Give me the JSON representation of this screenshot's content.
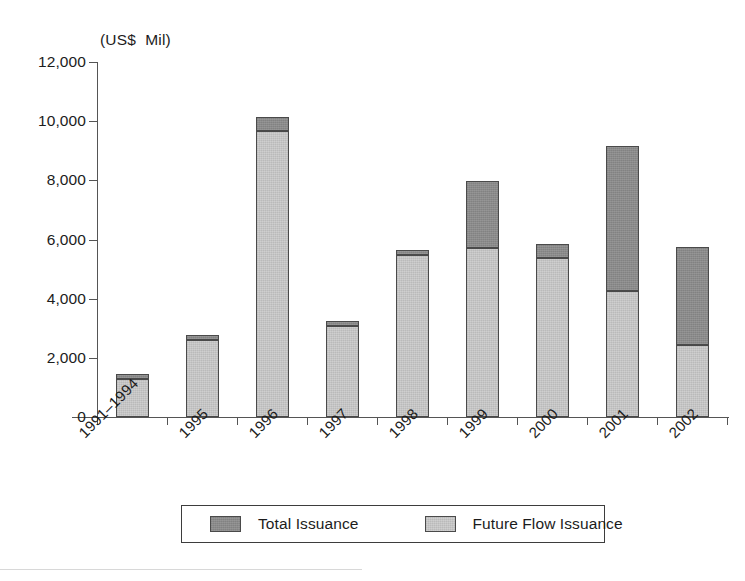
{
  "units_caption": "(US$  Mil)",
  "axis": {
    "y_ticks": [
      "0",
      "2,000",
      "4,000",
      "6,000",
      "8,000",
      "10,000",
      "12,000"
    ],
    "y_tick_values": [
      0,
      2000,
      4000,
      6000,
      8000,
      10000,
      12000
    ]
  },
  "legend": {
    "entries": [
      {
        "label": "Total Issuance",
        "color": "#8a8a8a"
      },
      {
        "label": "Future Flow Issuance",
        "color": "#c4c4c4"
      }
    ]
  },
  "colors": {
    "total_issuance": "#8a8a8a",
    "future_flow_issuance": "#c4c4c4",
    "outline": "#4a4a4a",
    "axis": "#555555",
    "text": "#1c1c1c",
    "background": "#ffffff"
  },
  "chart_data": {
    "type": "bar",
    "stacked": true,
    "title": "",
    "subtitle": "",
    "xlabel": "",
    "ylabel": "(US$  Mil)",
    "ylim": [
      0,
      12000
    ],
    "ytick_step": 2000,
    "grid": false,
    "legend_position": "bottom",
    "categories": [
      "1991–1994",
      "1995",
      "1996",
      "1997",
      "1998",
      "1999",
      "2000",
      "2001",
      "2002"
    ],
    "series": [
      {
        "name": "Future Flow Issuance",
        "color": "#c4c4c4",
        "values": [
          1280,
          2600,
          9660,
          3080,
          5470,
          5710,
          5370,
          4260,
          2430
        ]
      },
      {
        "name": "Total Issuance",
        "color": "#8a8a8a",
        "note": "Bar tops are the total; the dark segment is the portion above Future Flow Issuance.",
        "values": [
          1450,
          2770,
          10140,
          3250,
          5640,
          7970,
          5840,
          9160,
          5740
        ]
      }
    ]
  }
}
